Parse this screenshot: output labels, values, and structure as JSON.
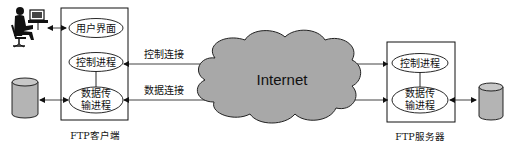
{
  "client": {
    "label": "FTP客户端",
    "user_interface": "用户界面",
    "control_process": "控制进程",
    "data_process_line1": "数据传",
    "data_process_line2": "输进程"
  },
  "server": {
    "label": "FTP服务器",
    "control_process": "控制进程",
    "data_process_line1": "数据传",
    "data_process_line2": "输进程"
  },
  "network": {
    "label": "Internet",
    "control_connection": "控制连接",
    "data_connection": "数据连接"
  },
  "icons": {
    "user": "user-at-computer-icon",
    "client_storage": "database-cylinder-icon",
    "server_storage": "database-cylinder-icon"
  },
  "colors": {
    "cloud_fill": "#a8a8a8",
    "cylinder_fill": "#b4b4b4",
    "stroke": "#111111"
  }
}
